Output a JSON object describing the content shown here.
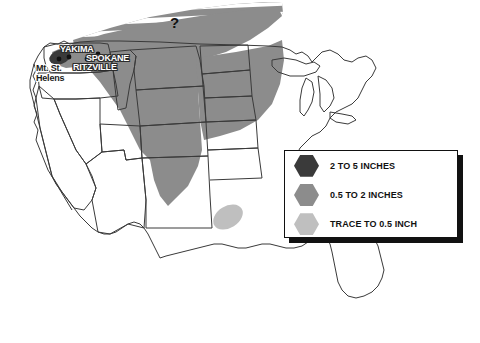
{
  "map": {
    "title": "Mount St. Helens Ashfall Distribution Map",
    "region": "Continental United States",
    "annotations": {
      "question_mark": "?"
    },
    "places": [
      {
        "name": "YAKIMA",
        "type": "city",
        "marker": "dot"
      },
      {
        "name": "SPOKANE",
        "type": "city",
        "marker": "dot"
      },
      {
        "name": "RITZVILLE",
        "type": "city",
        "marker": "dot"
      },
      {
        "name": "Mt. St. Helens",
        "type": "volcano",
        "marker": "dot"
      }
    ],
    "colors": {
      "background": "#ffffff",
      "outline": "#3a3a3a",
      "ash_heavy": "#3a3a3a",
      "ash_medium": "#8c8c8c",
      "ash_trace": "#bfbfbf",
      "label_text": "#ffffff",
      "label_outline": "#2b2b2b"
    }
  },
  "legend": {
    "name": "ashfall-thickness-legend",
    "items": [
      {
        "label": "2 TO 5 INCHES",
        "color": "#3a3a3a"
      },
      {
        "label": "0.5 TO 2 INCHES",
        "color": "#8c8c8c"
      },
      {
        "label": "TRACE TO 0.5 INCH",
        "color": "#bfbfbf"
      }
    ]
  }
}
